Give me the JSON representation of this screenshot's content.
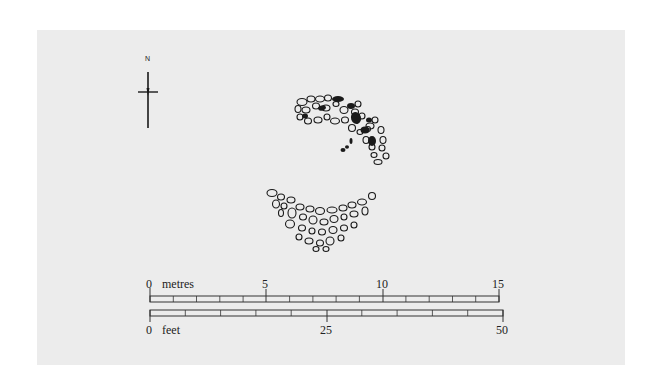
{
  "figure": {
    "type": "archaeological site plan",
    "background_color": "#ececec",
    "ink_color": "#1a1a1a"
  },
  "north_arrow": {
    "label": "N",
    "icon": "north-arrow-icon"
  },
  "features": [
    {
      "name": "curved-stone-setting-north",
      "description": "arc of outlined stones with some solid black stones"
    },
    {
      "name": "crescent-stone-setting-south",
      "description": "crescent of outlined stones"
    },
    {
      "name": "small-stones",
      "description": "two small black stones below northern arc"
    }
  ],
  "scale_bar": {
    "metres": {
      "unit_label": "metres",
      "ticks": [
        {
          "value": "0",
          "x": 150
        },
        {
          "value": "5",
          "x": 266
        },
        {
          "value": "10",
          "x": 383
        },
        {
          "value": "15",
          "x": 499
        }
      ],
      "max": 15,
      "divisions": 15
    },
    "feet": {
      "unit_label": "feet",
      "ticks": [
        {
          "value": "0",
          "x": 150
        },
        {
          "value": "25",
          "x": 327
        },
        {
          "value": "50",
          "x": 503
        }
      ],
      "max": 50,
      "divisions": 10
    }
  }
}
